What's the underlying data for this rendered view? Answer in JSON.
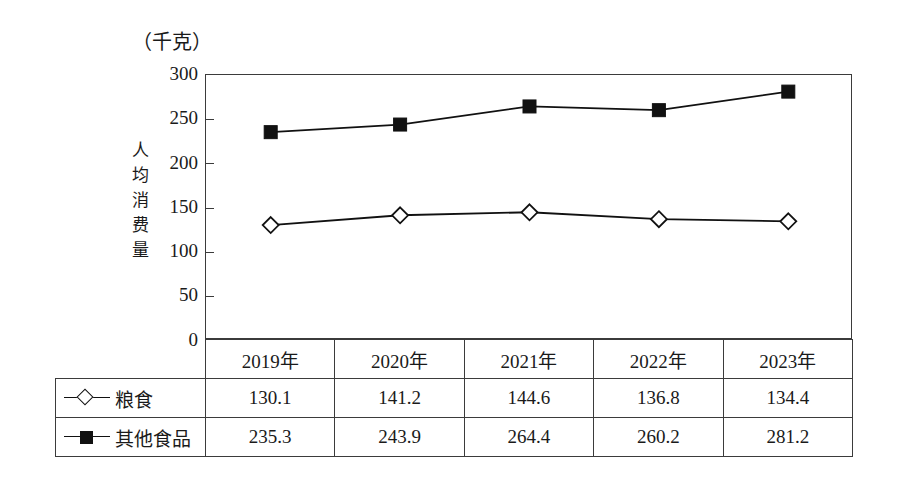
{
  "unit_label": "（千克）",
  "yaxis_title": "人均消费量",
  "yaxis_title_chars": [
    "人",
    "均",
    "消",
    "费",
    "量"
  ],
  "yticks": [
    "300",
    "250",
    "200",
    "150",
    "100",
    "50",
    "0"
  ],
  "legend": [
    {
      "marker": "open-diamond",
      "label": "粮食"
    },
    {
      "marker": "filled-square",
      "label": "其他食品"
    }
  ],
  "table": {
    "years": [
      "2019年",
      "2020年",
      "2021年",
      "2022年",
      "2023年"
    ],
    "rows": [
      {
        "label": "粮食",
        "values": [
          "130.1",
          "141.2",
          "144.6",
          "136.8",
          "134.4"
        ]
      },
      {
        "label": "其他食品",
        "values": [
          "235.3",
          "243.9",
          "264.4",
          "260.2",
          "281.2"
        ]
      }
    ]
  },
  "chart_data": {
    "type": "line",
    "title": "",
    "xlabel": "",
    "ylabel": "人均消费量",
    "unit": "千克",
    "categories": [
      "2019年",
      "2020年",
      "2021年",
      "2022年",
      "2023年"
    ],
    "ylim": [
      0,
      300
    ],
    "ytick_values": [
      0,
      50,
      100,
      150,
      200,
      250,
      300
    ],
    "grid": false,
    "legend_position": "bottom-table",
    "series": [
      {
        "name": "粮食",
        "marker": "open-diamond",
        "color": "#111111",
        "values": [
          130.1,
          141.2,
          144.6,
          136.8,
          134.4
        ]
      },
      {
        "name": "其他食品",
        "marker": "filled-square",
        "color": "#111111",
        "values": [
          235.3,
          243.9,
          264.4,
          260.2,
          281.2
        ]
      }
    ]
  }
}
